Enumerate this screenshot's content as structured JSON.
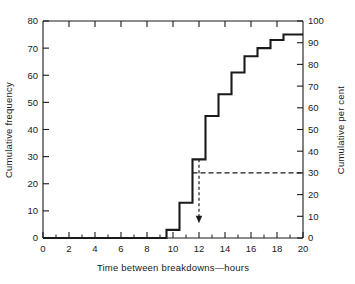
{
  "chart_data": {
    "type": "line",
    "subtype": "cumulative-frequency-step-ogive",
    "title": "",
    "xlabel": "Time between breakdowns—hours",
    "ylabel": "Cumulative frequency",
    "ylabel_right": "Cumulative per cent",
    "xlim": [
      0,
      20
    ],
    "ylim": [
      0,
      80
    ],
    "ylim_right": [
      0,
      100
    ],
    "grid": false,
    "legend": "none",
    "xticks": [
      0,
      2,
      4,
      6,
      8,
      10,
      12,
      14,
      16,
      18,
      20
    ],
    "xtick_labels": [
      "0",
      "2",
      "4",
      "6",
      "8",
      "10",
      "12",
      "14",
      "16",
      "18",
      "20"
    ],
    "xminor_ticks": [
      1,
      3,
      5,
      7,
      9,
      11,
      13,
      15,
      17,
      19
    ],
    "yticks": [
      0,
      10,
      20,
      30,
      40,
      50,
      60,
      70,
      80
    ],
    "ytick_labels": [
      "0",
      "10",
      "20",
      "30",
      "40",
      "50",
      "60",
      "70",
      "80"
    ],
    "yticks_right": [
      0,
      10,
      20,
      30,
      40,
      50,
      60,
      70,
      80,
      90,
      100
    ],
    "ytick_labels_right": [
      "0",
      "10",
      "20",
      "30",
      "40",
      "50",
      "60",
      "70",
      "80",
      "90",
      "100"
    ],
    "series": [
      {
        "name": "Cumulative frequency",
        "style": "step",
        "color": "#1a1a1a",
        "line_width": 2.1,
        "x": [
          0,
          9.5,
          10.5,
          11.5,
          12.5,
          13.5,
          14.5,
          15.5,
          16.5,
          17.5,
          18.5,
          20
        ],
        "values": [
          0,
          3,
          13,
          29,
          45,
          53,
          61,
          67,
          70,
          73,
          75,
          75
        ],
        "percent_values": [
          0,
          4,
          17,
          39,
          60,
          71,
          81,
          89,
          93,
          97,
          100,
          100
        ]
      }
    ],
    "annotations": [
      {
        "name": "median-horizontal-guide",
        "type": "dashed-horizontal",
        "y_percent": 30,
        "y_value": 24,
        "x_from": 11.5,
        "x_to": 20,
        "color": "#1a1a1a"
      },
      {
        "name": "median-vertical-arrow",
        "type": "dashed-vertical-arrow",
        "x": 12,
        "y_from": 29,
        "y_to": 6,
        "color": "#1a1a1a"
      }
    ]
  },
  "axes": {
    "x_title": "Time between breakdowns—hours",
    "y_left_title": "Cumulative frequency",
    "y_right_title": "Cumulative per cent"
  }
}
